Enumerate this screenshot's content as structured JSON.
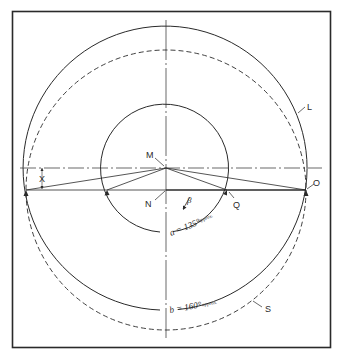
{
  "diagram": {
    "colors": {
      "ink": "#2a2a2a",
      "background": "#ffffff"
    },
    "points": {
      "M": {
        "label": "M",
        "x": 166,
        "y": 168
      },
      "N": {
        "label": "N",
        "x": 166,
        "y": 190
      },
      "O": {
        "label": "O",
        "x": 306,
        "y": 190
      },
      "Q": {
        "label": "Q",
        "x": 227,
        "y": 190
      },
      "left": {
        "x": 26,
        "y": 190
      }
    },
    "circles": {
      "L": {
        "label": "L",
        "center": "M",
        "r": 142,
        "style": "solid"
      },
      "S": {
        "label": "S",
        "center": "N",
        "r": 140,
        "style": "dashed"
      },
      "inner": {
        "center": "M",
        "r": 64,
        "style": "solid"
      }
    },
    "annotations": {
      "x_dimension": "X",
      "beta_symbol": "β",
      "angle_a": {
        "main": "a = 135°",
        "suffix": "approx."
      },
      "angle_b": {
        "main": "b = 160°",
        "suffix": "approx."
      }
    }
  }
}
